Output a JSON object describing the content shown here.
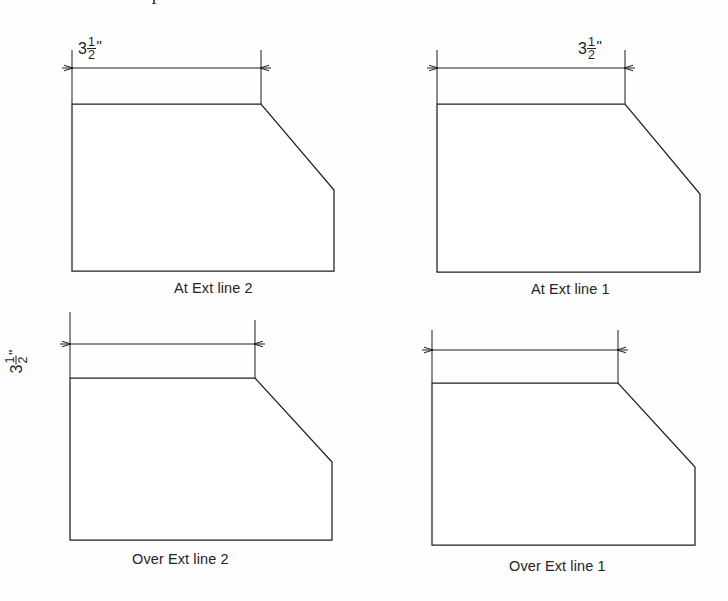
{
  "page": {
    "clipped_header_text": "a point is included in our choices.",
    "background_color": "#fefefe",
    "line_color": "#1f1f1f"
  },
  "dimension_value": {
    "whole": "3",
    "numerator": "1",
    "denominator": "2",
    "unit_mark": "\""
  },
  "figures": [
    {
      "id": "at-ext-line-2",
      "caption": "At Ext line 2",
      "text_placement": "inside-left",
      "text_visible": true,
      "text_rotated": false,
      "shape": {
        "top_left": [
          72,
          104
        ],
        "chamfer_start": [
          261,
          104
        ],
        "chamfer_end": [
          334,
          190
        ],
        "bottom_right": [
          334,
          271
        ],
        "bottom_left": [
          72,
          271
        ]
      },
      "dimension": {
        "line_y": 68,
        "left_x": 72,
        "right_x": 261,
        "ext_line_top": 50,
        "ext_line_bottom": 104
      }
    },
    {
      "id": "at-ext-line-1",
      "caption": "At Ext line 1",
      "text_placement": "inside-right",
      "text_visible": true,
      "text_rotated": false,
      "shape": {
        "top_left": [
          437,
          104
        ],
        "chamfer_start": [
          625,
          104
        ],
        "chamfer_end": [
          700,
          194
        ],
        "bottom_right": [
          700,
          272
        ],
        "bottom_left": [
          437,
          272
        ]
      },
      "dimension": {
        "line_y": 68,
        "left_x": 437,
        "right_x": 625,
        "ext_line_top": 50,
        "ext_line_bottom": 104
      }
    },
    {
      "id": "over-ext-line-2",
      "caption": "Over Ext line 2",
      "text_placement": "outside-left-rotated",
      "text_visible": true,
      "text_rotated": true,
      "shape": {
        "top_left": [
          70,
          378
        ],
        "chamfer_start": [
          255,
          378
        ],
        "chamfer_end": [
          332,
          462
        ],
        "bottom_right": [
          332,
          540
        ],
        "bottom_left": [
          70,
          540
        ]
      },
      "dimension": {
        "line_y": 344,
        "left_x": 70,
        "right_x": 255,
        "ext_line_top": 312,
        "ext_line_bottom": 378
      }
    },
    {
      "id": "over-ext-line-1",
      "caption": "Over Ext line 1",
      "text_placement": "hidden",
      "text_visible": false,
      "text_rotated": false,
      "shape": {
        "top_left": [
          432,
          383
        ],
        "chamfer_start": [
          618,
          383
        ],
        "chamfer_end": [
          695,
          467
        ],
        "bottom_right": [
          695,
          545
        ],
        "bottom_left": [
          432,
          545
        ]
      },
      "dimension": {
        "line_y": 350,
        "left_x": 432,
        "right_x": 618,
        "ext_line_top": 330,
        "ext_line_bottom": 383
      }
    }
  ],
  "captions": {
    "at_ext_line_2": "At Ext line 2",
    "at_ext_line_1": "At Ext line 1",
    "over_ext_line_2": "Over Ext line 2",
    "over_ext_line_1": "Over Ext line 1"
  }
}
